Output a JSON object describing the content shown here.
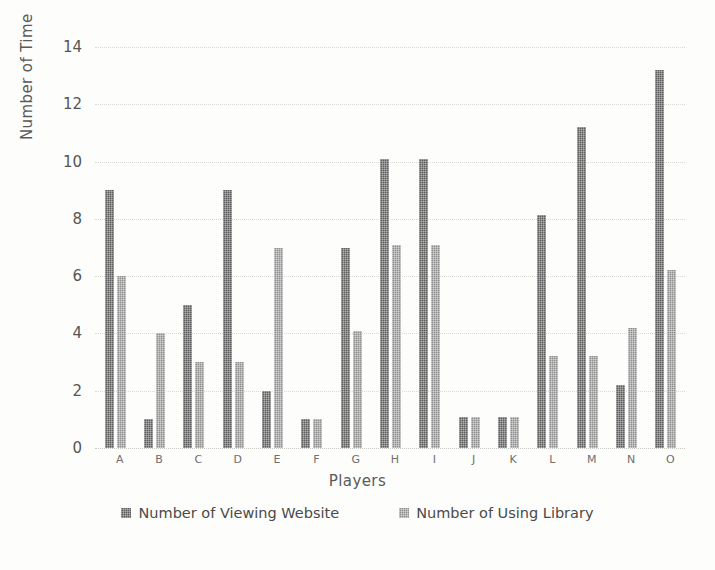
{
  "chart_data": {
    "type": "bar",
    "title": "",
    "xlabel": "Players",
    "ylabel": "Number of Time",
    "categories": [
      "A",
      "B",
      "C",
      "D",
      "E",
      "F",
      "G",
      "H",
      "I",
      "J",
      "K",
      "L",
      "M",
      "N",
      "O"
    ],
    "series": [
      {
        "name": "Number of Viewing Website",
        "color": "#5d5d5d",
        "values": [
          9,
          1,
          5,
          9,
          2,
          1,
          7,
          10.1,
          10.1,
          1.1,
          1.1,
          8.15,
          11.2,
          2.2,
          13.2
        ]
      },
      {
        "name": "Number of Using Library",
        "color": "#8e8e8e",
        "values": [
          6,
          4,
          3,
          3,
          7,
          1,
          4.1,
          7.1,
          7.1,
          1.1,
          1.1,
          3.2,
          3.2,
          4.2,
          6.2
        ]
      }
    ],
    "ylim": [
      0,
      14
    ],
    "yticks": [
      0,
      2,
      4,
      6,
      8,
      10,
      12,
      14
    ],
    "ytick_labels": [
      "0",
      "2",
      "4",
      "6",
      "8",
      "10",
      "12",
      "14"
    ],
    "grid": true,
    "legend_position": "bottom"
  }
}
